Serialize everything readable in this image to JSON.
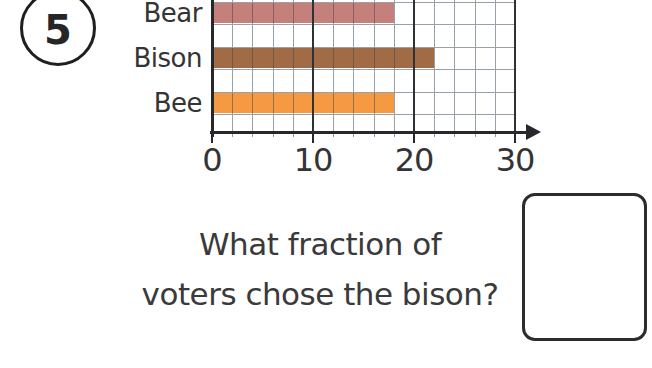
{
  "question": {
    "number": "5",
    "text_line1": "What fraction of",
    "text_line2": "voters chose the bison?"
  },
  "answer_box": {
    "value": ""
  },
  "chart_data": {
    "type": "bar",
    "orientation": "horizontal",
    "title": "",
    "categories": [
      "Bear",
      "Bison",
      "Bee"
    ],
    "values": [
      18,
      22,
      18
    ],
    "colors": [
      "#c5807c",
      "#a06b45",
      "#f69943"
    ],
    "xticks": [
      0,
      10,
      20,
      30
    ],
    "xlim": [
      0,
      30
    ],
    "minor_grid_step": 2,
    "grid": "on",
    "axis_arrow": "right",
    "layout": "cropped at top edge; bars start at left axis"
  }
}
